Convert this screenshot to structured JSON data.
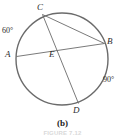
{
  "figure": {
    "caption": "(b)",
    "figure_number": "FIGURE 7.12",
    "stroke_color": "#6b6b6b",
    "text_color": "#2b2b2b"
  },
  "diagram": {
    "type": "circle-with-chords",
    "circle": {
      "cx": 62,
      "cy": 59,
      "r": 46
    },
    "points": [
      {
        "id": "C",
        "label": "C",
        "x": 42.5,
        "y": 14.5
      },
      {
        "id": "B",
        "label": "B",
        "x": 104.5,
        "y": 43.5
      },
      {
        "id": "A",
        "label": "A",
        "x": 16.5,
        "y": 56.5
      },
      {
        "id": "D",
        "label": "D",
        "x": 78.5,
        "y": 103.5
      },
      {
        "id": "E",
        "label": "E",
        "x": 57.5,
        "y": 57.0
      }
    ],
    "chords": [
      {
        "id": "CB",
        "from": "C",
        "to": "B"
      },
      {
        "id": "CD",
        "from": "C",
        "to": "D"
      },
      {
        "id": "AB",
        "from": "A",
        "to": "B"
      }
    ],
    "arc_labels": [
      {
        "id": "arc-AC",
        "text": "60°",
        "arc": "AC"
      },
      {
        "id": "arc-BD",
        "text": "90°",
        "arc": "BD"
      }
    ]
  }
}
